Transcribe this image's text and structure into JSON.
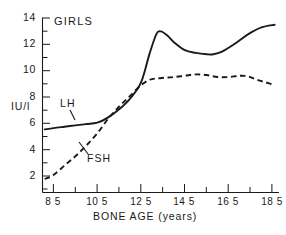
{
  "chart_data": {
    "type": "line",
    "title": "GIRLS",
    "xlabel": "BONE AGE (years)",
    "ylabel": "IU/l",
    "xlim": [
      8.0,
      18.8
    ],
    "ylim": [
      1.0,
      14.0
    ],
    "grid": false,
    "legend_position": "inline-annotation",
    "x_ticks_major": [
      "8.5",
      "10.5",
      "12.5",
      "14.5",
      "16.5",
      "18.5"
    ],
    "x_ticks_major_values": [
      8.5,
      10.5,
      12.5,
      14.5,
      16.5,
      18.5
    ],
    "x_ticks_minor_values": [
      9.5,
      11.5,
      13.5,
      15.5,
      17.5
    ],
    "y_ticks_major": [
      "2",
      "4",
      "6",
      "8",
      "10",
      "12",
      "14"
    ],
    "y_ticks_major_values": [
      2,
      4,
      6,
      8,
      10,
      12,
      14
    ],
    "y_ticks_minor_values": [
      1,
      3,
      5,
      7,
      9,
      11,
      13
    ],
    "series": [
      {
        "name": "LH",
        "style": "solid",
        "x": [
          8.1,
          8.5,
          9.0,
          9.5,
          10.0,
          10.5,
          11.0,
          11.5,
          12.0,
          12.5,
          12.9,
          13.2,
          13.4,
          13.7,
          14.0,
          14.5,
          15.0,
          15.5,
          15.8,
          16.2,
          16.8,
          17.4,
          18.0,
          18.6
        ],
        "y": [
          5.7,
          5.8,
          5.9,
          6.0,
          6.1,
          6.2,
          6.6,
          7.2,
          8.0,
          9.2,
          11.4,
          12.8,
          13.0,
          12.7,
          12.2,
          11.6,
          11.4,
          11.3,
          11.3,
          11.5,
          12.1,
          12.8,
          13.3,
          13.5
        ]
      },
      {
        "name": "FSH",
        "style": "dashed",
        "x": [
          8.1,
          8.5,
          9.0,
          9.5,
          10.0,
          10.5,
          11.0,
          11.5,
          12.0,
          12.5,
          12.9,
          13.2,
          13.6,
          14.0,
          14.5,
          15.0,
          15.5,
          16.0,
          16.5,
          17.0,
          17.4,
          17.8,
          18.2,
          18.6
        ],
        "y": [
          2.0,
          2.3,
          3.0,
          3.7,
          4.5,
          5.4,
          6.5,
          7.4,
          8.2,
          9.0,
          9.4,
          9.5,
          9.55,
          9.6,
          9.7,
          9.8,
          9.75,
          9.6,
          9.6,
          9.7,
          9.65,
          9.4,
          9.2,
          9.0
        ]
      }
    ],
    "annotations": [
      {
        "text": "GIRLS",
        "role": "panel-label"
      },
      {
        "text": "LH",
        "role": "series-label"
      },
      {
        "text": "FSH",
        "role": "series-label"
      }
    ],
    "colors": {
      "ink": "#1a1a1a",
      "background": "#ffffff"
    }
  },
  "labels": {
    "panel": "GIRLS",
    "y_axis_title": "IU/l",
    "x_axis_title": "BONE AGE (years)",
    "series_lh": "LH",
    "series_fsh": "FSH"
  },
  "y_ticks": [
    {
      "text": "14"
    },
    {
      "text": "12"
    },
    {
      "text": "10"
    },
    {
      "text": "8"
    },
    {
      "text": "6"
    },
    {
      "text": "4"
    },
    {
      "text": "2"
    }
  ],
  "x_ticks": [
    {
      "text": "8 5"
    },
    {
      "text": "10 5"
    },
    {
      "text": "12 5"
    },
    {
      "text": "14 5"
    },
    {
      "text": "16 5"
    },
    {
      "text": "18 5"
    }
  ]
}
